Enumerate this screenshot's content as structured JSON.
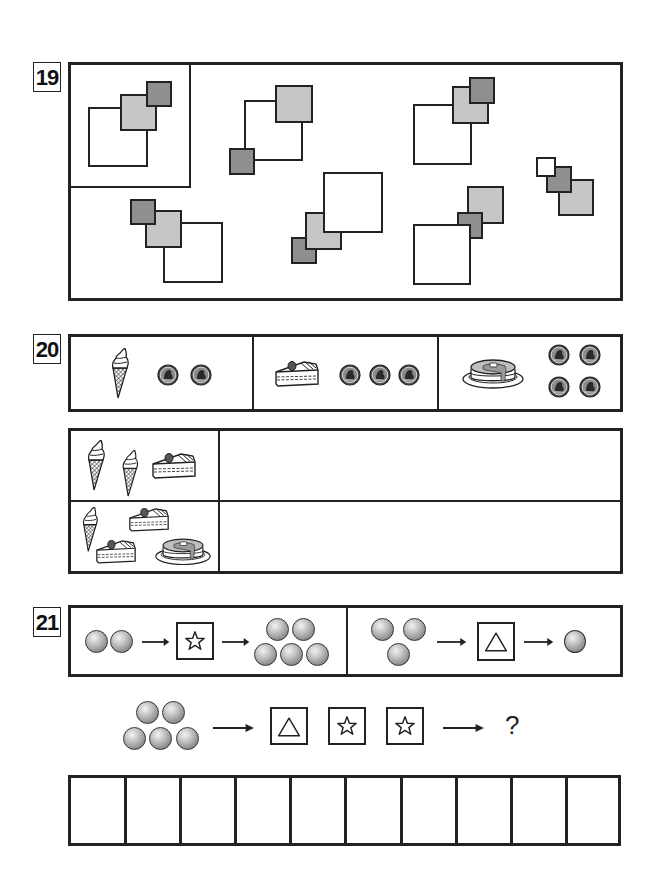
{
  "problems": [
    {
      "number": "19",
      "type": "pick-matching-arrangement",
      "reference_figure": {
        "squares": [
          "white-large",
          "light-medium",
          "dark-small"
        ]
      },
      "options_count": 7
    },
    {
      "number": "20",
      "type": "price-calculation",
      "price_list": [
        {
          "item": "ice-cream-cone",
          "coins": 2
        },
        {
          "item": "cake-slice",
          "coins": 3
        },
        {
          "item": "pancake",
          "coins": 4
        }
      ],
      "questions": [
        {
          "items": [
            "ice-cream-cone",
            "ice-cream-cone",
            "cake-slice"
          ],
          "answer": ""
        },
        {
          "items": [
            "ice-cream-cone",
            "cake-slice",
            "cake-slice",
            "pancake"
          ],
          "answer": ""
        }
      ]
    },
    {
      "number": "21",
      "type": "function-machine",
      "rules": [
        {
          "input_balls": 2,
          "operator": "star",
          "output_balls": 5
        },
        {
          "input_balls": 3,
          "operator": "triangle",
          "output_balls": 1
        }
      ],
      "question": {
        "input_balls": 5,
        "operators": [
          "triangle",
          "star",
          "star"
        ],
        "result": "?"
      },
      "answer_cells": 10
    }
  ],
  "colors": {
    "line": "#222222",
    "light_gray": "#c6c6c6",
    "dark_gray": "#8f8f8f",
    "background": "#ffffff"
  }
}
